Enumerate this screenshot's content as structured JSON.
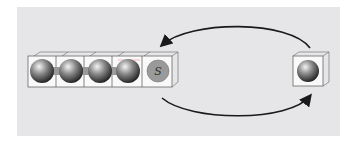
{
  "diagram": {
    "chain": {
      "cells": [
        {
          "content": "particle"
        },
        {
          "content": "particle"
        },
        {
          "content": "particle"
        },
        {
          "content": "particle"
        },
        {
          "content": "site",
          "label": "S"
        }
      ]
    },
    "isolated_cell": {
      "content": "particle"
    },
    "arrows": [
      {
        "name": "top-arrow",
        "from": "isolated_cell",
        "to": "chain_end"
      },
      {
        "name": "bottom-arrow",
        "from": "chain_end",
        "to": "isolated_cell"
      }
    ],
    "colors": {
      "background": "#e6e6e8",
      "cell_edge": "#555555",
      "particle_dark": "#2a2a2a",
      "particle_light": "#f0f0f0",
      "site_fill": "#9a9a9a",
      "arrow": "#1a1a1a"
    }
  }
}
